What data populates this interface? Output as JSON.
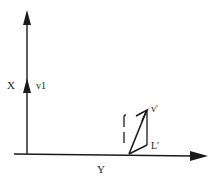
{
  "diagram": {
    "type": "vector-diagram",
    "colors": {
      "stroke": "#1a1a1a",
      "background": "#ffffff"
    },
    "axes": {
      "vertical": {
        "label": "X"
      },
      "horizontal": {
        "label": "Y"
      }
    },
    "vectors": [
      {
        "id": "v1",
        "label": "v1"
      },
      {
        "id": "v-prime",
        "label": "v'"
      },
      {
        "id": "l-prime",
        "label": "L'"
      }
    ],
    "side_marks": {
      "upper": "ſ",
      "lower": "|"
    }
  }
}
